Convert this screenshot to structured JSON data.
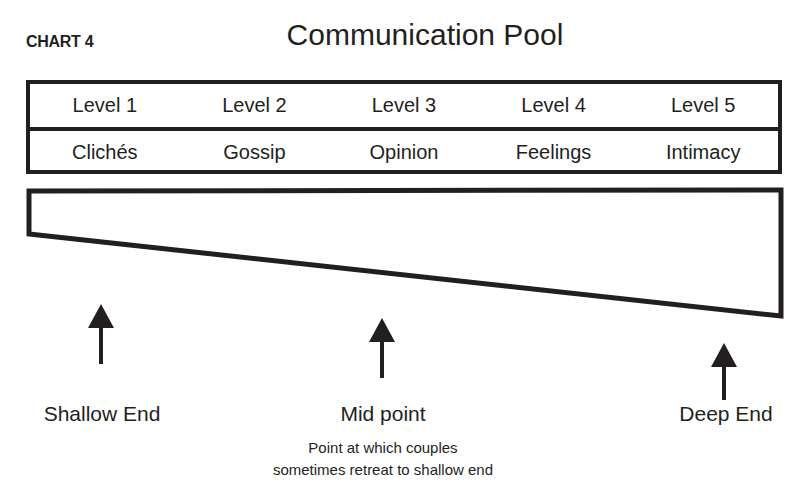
{
  "header": {
    "chart_label": "CHART 4",
    "title": "Communication Pool"
  },
  "levels": [
    {
      "level": "Level 1",
      "name": "Clichés"
    },
    {
      "level": "Level 2",
      "name": "Gossip"
    },
    {
      "level": "Level 3",
      "name": "Opinion"
    },
    {
      "level": "Level 4",
      "name": "Feelings"
    },
    {
      "level": "Level 5",
      "name": "Intimacy"
    }
  ],
  "markers": {
    "shallow": {
      "label": "Shallow End"
    },
    "mid": {
      "label": "Mid point",
      "note_line1": "Point at which couples",
      "note_line2": "sometimes retreat to shallow end"
    },
    "deep": {
      "label": "Deep End"
    }
  },
  "icons": {
    "arrow": "arrow-up-icon"
  },
  "colors": {
    "ink": "#231f20",
    "background": "#ffffff"
  }
}
